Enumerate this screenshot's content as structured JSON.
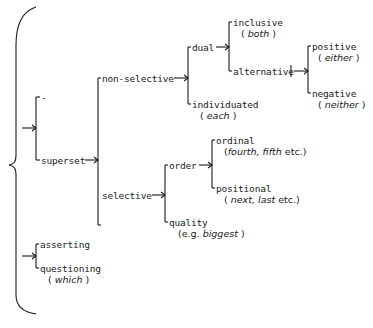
{
  "diagram": {
    "type": "system-network",
    "root": {
      "bracket": "brace",
      "systems": [
        {
          "label": "",
          "options": [
            {
              "label": "-"
            },
            {
              "label": "superset",
              "options": [
                {
                  "label": "non-selective",
                  "options": [
                    {
                      "label": "dual",
                      "options": [
                        {
                          "label": "inclusive",
                          "example": "both"
                        },
                        {
                          "label": "alternative",
                          "options": [
                            {
                              "label": "positive",
                              "example": "either"
                            },
                            {
                              "label": "negative",
                              "example": "neither"
                            }
                          ]
                        }
                      ]
                    },
                    {
                      "label": "individuated",
                      "example": "each"
                    }
                  ]
                },
                {
                  "label": "selective",
                  "options": [
                    {
                      "label": "order",
                      "options": [
                        {
                          "label": "ordinal",
                          "example": "fourth, fifth",
                          "suffix": "etc."
                        },
                        {
                          "label": "positional",
                          "example": "next, last",
                          "suffix": "etc."
                        }
                      ]
                    },
                    {
                      "label": "quality",
                      "prefix": "e.g.",
                      "example": "biggest"
                    }
                  ]
                }
              ]
            }
          ]
        },
        {
          "label": "",
          "options": [
            {
              "label": "asserting"
            },
            {
              "label": "questioning",
              "example": "which"
            }
          ]
        }
      ]
    }
  },
  "labels": {
    "dash": "-",
    "superset": "superset",
    "non_selective": "non-selective",
    "dual": "dual",
    "inclusive": "inclusive",
    "inclusive_ex": "both",
    "alternative": "alternative",
    "positive": "positive",
    "positive_ex": "either",
    "negative": "negative",
    "negative_ex": "neither",
    "individuated": "individuated",
    "individuated_ex": "each",
    "selective": "selective",
    "order": "order",
    "ordinal": "ordinal",
    "ordinal_ex": "fourth, fifth",
    "ordinal_suffix": " etc.",
    "positional": "positional",
    "positional_ex": "next, last",
    "positional_suffix": " etc.",
    "quality": "quality",
    "quality_prefix": "e.g. ",
    "quality_ex": "biggest",
    "asserting": "asserting",
    "questioning": "questioning",
    "questioning_ex": "which",
    "open_paren": "( ",
    "close_paren": " )"
  },
  "colors": {
    "ink": "#1a1a1a",
    "background": "#ffffff"
  }
}
